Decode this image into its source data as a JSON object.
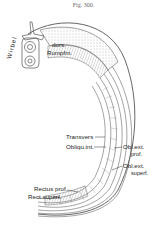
{
  "figure": {
    "title": "Fig. 300.",
    "labels": {
      "wirbel": "Wirbel",
      "dors_line1": "dors.",
      "dors_line2": "Rumpfm.",
      "transversus": "Transvers",
      "obliqu_int": "Obliqu.int.",
      "obl_ext_prof_line1": "Obl.ext.",
      "obl_ext_prof_line2": "prof.",
      "obl_ext_superf_line1": "Obl.ext.",
      "obl_ext_superf_line2": "superf.",
      "rectus_prof": "Rectus prof.",
      "rect_superf": "Rect.superf."
    }
  }
}
